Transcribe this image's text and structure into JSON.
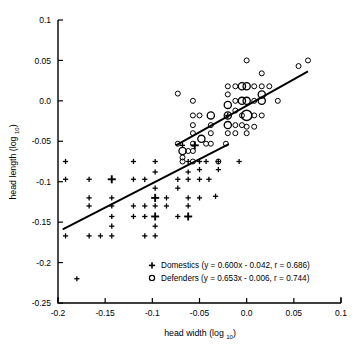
{
  "chart_data": {
    "type": "scatter",
    "title": "",
    "xlabel": "head width (log 10)",
    "xlabel_main": "head width (log",
    "xlabel_sub": "10",
    "xlabel_close": ")",
    "ylabel": "head length (log 10)",
    "ylabel_main": "head length (log",
    "ylabel_sub": "10",
    "ylabel_close": ")",
    "xlim": [
      -0.2,
      0.1
    ],
    "ylim": [
      -0.25,
      0.1
    ],
    "xticks": [
      -0.2,
      -0.15,
      -0.1,
      -0.05,
      0.0,
      0.05,
      0.1
    ],
    "xticklabels": [
      "-0.2",
      "-0.15",
      "-0.1",
      "-0.05",
      "0.0",
      "0.05",
      "0.1"
    ],
    "yticks": [
      -0.25,
      -0.2,
      -0.15,
      -0.1,
      -0.05,
      0.0,
      0.05,
      0.1
    ],
    "yticklabels": [
      "-0.25",
      "-0.2",
      "-0.15",
      "-0.1",
      "-0.05",
      "0.0",
      "0.05",
      "0.1"
    ],
    "grid": false,
    "legend_position": "lower right",
    "series": [
      {
        "name": "Domestics",
        "marker": "plus",
        "legend_label": "Domestics (y = 0.600x - 0.042, r = 0.686)",
        "equation": "y = 0.600x - 0.042",
        "slope": 0.6,
        "intercept": -0.042,
        "r": 0.686,
        "fit_x": [
          -0.195,
          -0.019
        ],
        "points": [
          {
            "x": -0.192,
            "y": -0.075,
            "size": 1
          },
          {
            "x": -0.192,
            "y": -0.097,
            "size": 1
          },
          {
            "x": -0.192,
            "y": -0.167,
            "size": 1
          },
          {
            "x": -0.167,
            "y": -0.097,
            "size": 1
          },
          {
            "x": -0.167,
            "y": -0.12,
            "size": 1
          },
          {
            "x": -0.167,
            "y": -0.13,
            "size": 1
          },
          {
            "x": -0.167,
            "y": -0.167,
            "size": 1
          },
          {
            "x": -0.155,
            "y": -0.167,
            "size": 1
          },
          {
            "x": -0.143,
            "y": -0.097,
            "size": 2
          },
          {
            "x": -0.143,
            "y": -0.12,
            "size": 1
          },
          {
            "x": -0.143,
            "y": -0.13,
            "size": 1
          },
          {
            "x": -0.143,
            "y": -0.143,
            "size": 1
          },
          {
            "x": -0.143,
            "y": -0.155,
            "size": 1
          },
          {
            "x": -0.143,
            "y": -0.167,
            "size": 1
          },
          {
            "x": -0.12,
            "y": -0.075,
            "size": 1
          },
          {
            "x": -0.12,
            "y": -0.097,
            "size": 1
          },
          {
            "x": -0.12,
            "y": -0.13,
            "size": 1
          },
          {
            "x": -0.12,
            "y": -0.143,
            "size": 1
          },
          {
            "x": -0.108,
            "y": -0.097,
            "size": 1
          },
          {
            "x": -0.108,
            "y": -0.13,
            "size": 1
          },
          {
            "x": -0.108,
            "y": -0.143,
            "size": 1
          },
          {
            "x": -0.108,
            "y": -0.167,
            "size": 1
          },
          {
            "x": -0.097,
            "y": -0.075,
            "size": 1
          },
          {
            "x": -0.097,
            "y": -0.088,
            "size": 1
          },
          {
            "x": -0.097,
            "y": -0.108,
            "size": 1
          },
          {
            "x": -0.097,
            "y": -0.12,
            "size": 2
          },
          {
            "x": -0.097,
            "y": -0.13,
            "size": 1
          },
          {
            "x": -0.097,
            "y": -0.143,
            "size": 2
          },
          {
            "x": -0.097,
            "y": -0.155,
            "size": 1
          },
          {
            "x": -0.097,
            "y": -0.167,
            "size": 1
          },
          {
            "x": -0.085,
            "y": -0.12,
            "size": 1
          },
          {
            "x": -0.085,
            "y": -0.13,
            "size": 1
          },
          {
            "x": -0.073,
            "y": -0.097,
            "size": 1
          },
          {
            "x": -0.073,
            "y": -0.108,
            "size": 1
          },
          {
            "x": -0.073,
            "y": -0.143,
            "size": 1
          },
          {
            "x": -0.068,
            "y": -0.055,
            "size": 1
          },
          {
            "x": -0.062,
            "y": -0.075,
            "size": 1
          },
          {
            "x": -0.062,
            "y": -0.088,
            "size": 1
          },
          {
            "x": -0.062,
            "y": -0.097,
            "size": 1
          },
          {
            "x": -0.062,
            "y": -0.12,
            "size": 1
          },
          {
            "x": -0.062,
            "y": -0.13,
            "size": 1
          },
          {
            "x": -0.062,
            "y": -0.143,
            "size": 2
          },
          {
            "x": -0.055,
            "y": -0.055,
            "size": 2
          },
          {
            "x": -0.05,
            "y": -0.075,
            "size": 1
          },
          {
            "x": -0.05,
            "y": -0.085,
            "size": 1
          },
          {
            "x": -0.05,
            "y": -0.097,
            "size": 1
          },
          {
            "x": -0.05,
            "y": -0.12,
            "size": 1
          },
          {
            "x": -0.043,
            "y": -0.075,
            "size": 1
          },
          {
            "x": -0.04,
            "y": -0.097,
            "size": 1
          },
          {
            "x": -0.033,
            "y": -0.118,
            "size": 1
          },
          {
            "x": -0.03,
            "y": -0.075,
            "size": 1
          },
          {
            "x": -0.03,
            "y": -0.085,
            "size": 1
          },
          {
            "x": -0.02,
            "y": -0.018,
            "size": 1
          },
          {
            "x": -0.008,
            "y": -0.075,
            "size": 1
          },
          {
            "x": -0.18,
            "y": -0.22,
            "size": 1
          }
        ]
      },
      {
        "name": "Defenders",
        "marker": "circle",
        "legend_label": "Defenders (y = 0.653x - 0.006, r = 0.744)",
        "equation": "y = 0.653x - 0.006",
        "slope": 0.653,
        "intercept": -0.006,
        "r": 0.744,
        "fit_x": [
          -0.075,
          0.065
        ],
        "points": [
          {
            "x": -0.073,
            "y": 0.009,
            "size": 1
          },
          {
            "x": -0.073,
            "y": -0.053,
            "size": 1
          },
          {
            "x": -0.068,
            "y": -0.062,
            "size": 2
          },
          {
            "x": -0.068,
            "y": -0.07,
            "size": 1
          },
          {
            "x": -0.068,
            "y": -0.075,
            "size": 1
          },
          {
            "x": -0.062,
            "y": -0.062,
            "size": 1
          },
          {
            "x": -0.057,
            "y": 0.0,
            "size": 1
          },
          {
            "x": -0.057,
            "y": -0.018,
            "size": 1
          },
          {
            "x": -0.057,
            "y": -0.03,
            "size": 1
          },
          {
            "x": -0.057,
            "y": -0.04,
            "size": 1
          },
          {
            "x": -0.057,
            "y": -0.053,
            "size": 1
          },
          {
            "x": -0.057,
            "y": -0.062,
            "size": 1
          },
          {
            "x": -0.057,
            "y": -0.075,
            "size": 1
          },
          {
            "x": -0.05,
            "y": -0.018,
            "size": 1
          },
          {
            "x": -0.048,
            "y": -0.047,
            "size": 2
          },
          {
            "x": -0.043,
            "y": -0.053,
            "size": 1
          },
          {
            "x": -0.038,
            "y": -0.018,
            "size": 2
          },
          {
            "x": -0.038,
            "y": -0.03,
            "size": 1
          },
          {
            "x": -0.038,
            "y": -0.04,
            "size": 1
          },
          {
            "x": -0.038,
            "y": -0.053,
            "size": 1
          },
          {
            "x": -0.03,
            "y": -0.075,
            "size": 1
          },
          {
            "x": -0.022,
            "y": -0.053,
            "size": 1
          },
          {
            "x": -0.02,
            "y": 0.018,
            "size": 1
          },
          {
            "x": -0.02,
            "y": 0.008,
            "size": 1
          },
          {
            "x": -0.02,
            "y": -0.005,
            "size": 2
          },
          {
            "x": -0.02,
            "y": -0.018,
            "size": 2
          },
          {
            "x": -0.02,
            "y": -0.03,
            "size": 2
          },
          {
            "x": -0.02,
            "y": -0.04,
            "size": 1
          },
          {
            "x": -0.012,
            "y": 0.018,
            "size": 1
          },
          {
            "x": -0.012,
            "y": 0.0,
            "size": 1
          },
          {
            "x": -0.012,
            "y": -0.012,
            "size": 1
          },
          {
            "x": -0.012,
            "y": -0.03,
            "size": 1
          },
          {
            "x": -0.012,
            "y": -0.04,
            "size": 1
          },
          {
            "x": -0.005,
            "y": 0.018,
            "size": 2
          },
          {
            "x": -0.005,
            "y": 0.0,
            "size": 2
          },
          {
            "x": -0.005,
            "y": -0.018,
            "size": 1
          },
          {
            "x": -0.005,
            "y": -0.03,
            "size": 1
          },
          {
            "x": 0.0,
            "y": 0.05,
            "size": 1
          },
          {
            "x": 0.0,
            "y": 0.018,
            "size": 2
          },
          {
            "x": 0.0,
            "y": 0.0,
            "size": 2
          },
          {
            "x": 0.0,
            "y": -0.018,
            "size": 3
          },
          {
            "x": 0.0,
            "y": -0.032,
            "size": 1
          },
          {
            "x": 0.0,
            "y": -0.04,
            "size": 1
          },
          {
            "x": 0.008,
            "y": 0.018,
            "size": 1
          },
          {
            "x": 0.008,
            "y": 0.0,
            "size": 1
          },
          {
            "x": 0.008,
            "y": -0.018,
            "size": 1
          },
          {
            "x": 0.008,
            "y": -0.032,
            "size": 1
          },
          {
            "x": 0.016,
            "y": 0.034,
            "size": 1
          },
          {
            "x": 0.016,
            "y": 0.018,
            "size": 1
          },
          {
            "x": 0.016,
            "y": 0.008,
            "size": 2
          },
          {
            "x": 0.016,
            "y": 0.0,
            "size": 2
          },
          {
            "x": 0.016,
            "y": -0.018,
            "size": 1
          },
          {
            "x": 0.024,
            "y": 0.018,
            "size": 1
          },
          {
            "x": 0.033,
            "y": 0.0,
            "size": 1
          },
          {
            "x": 0.055,
            "y": 0.043,
            "size": 1
          },
          {
            "x": 0.065,
            "y": 0.05,
            "size": 1
          }
        ]
      }
    ]
  },
  "legend": {
    "entries": [
      {
        "marker": "plus",
        "label": "Domestics (y = 0.600x - 0.042, r = 0.686)"
      },
      {
        "marker": "circle",
        "label": "Defenders (y = 0.653x - 0.006, r = 0.744)"
      }
    ]
  },
  "colors": {
    "foreground": "#000000",
    "background": "#ffffff"
  }
}
